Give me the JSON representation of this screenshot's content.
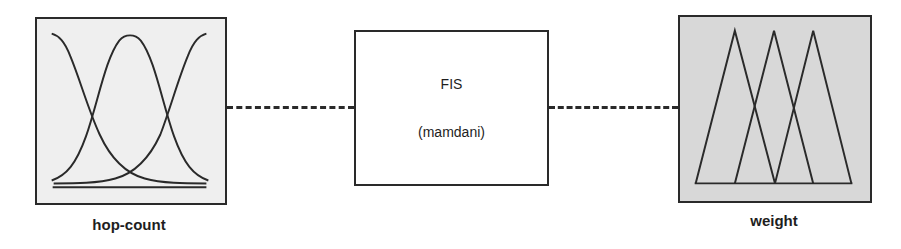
{
  "diagram": {
    "type": "fuzzy-inference-system",
    "input": {
      "label": "hop-count",
      "membership_shape": "gaussian",
      "membership_functions": 3,
      "background": "#efefef"
    },
    "system": {
      "name": "FIS",
      "type": "(mamdani)",
      "background": "#ffffff"
    },
    "output": {
      "label": "weight",
      "membership_shape": "triangular",
      "membership_functions": 3,
      "background": "#d8d8d8"
    },
    "connectors": [
      {
        "from": "input",
        "to": "system",
        "style": "dashed"
      },
      {
        "from": "system",
        "to": "output",
        "style": "dashed"
      }
    ],
    "colors": {
      "stroke": "#2a2a2a",
      "text": "#1e1e1e"
    }
  }
}
